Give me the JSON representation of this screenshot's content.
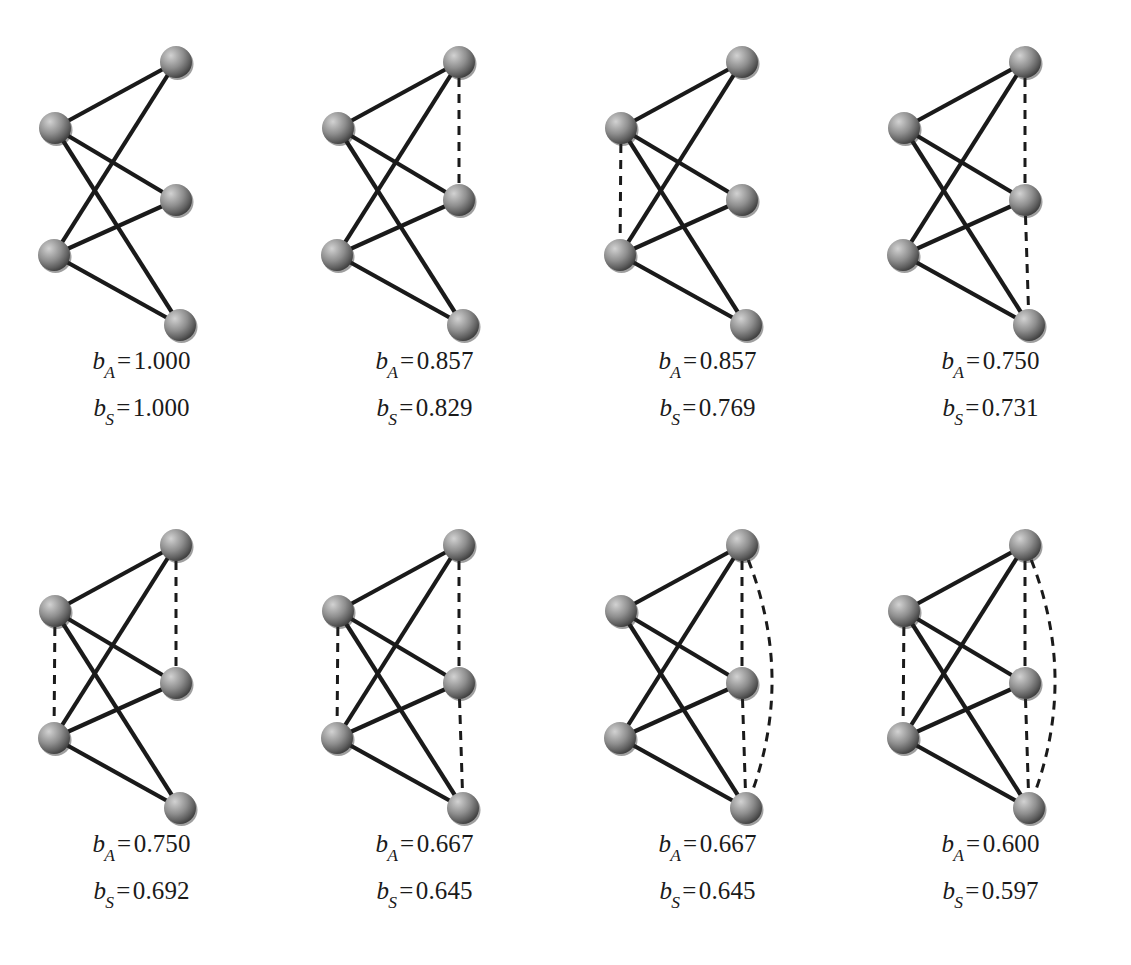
{
  "figure": {
    "node_count_per_graph": 5,
    "grid": {
      "rows": 2,
      "cols": 4
    },
    "colors": {
      "node_fill_light": "#b9b9b9",
      "node_fill_mid": "#8a8a8a",
      "node_fill_dark": "#3a3a3a",
      "edge_solid": "#1a1a1a",
      "edge_dashed": "#1a1a1a",
      "background": "#ffffff",
      "text": "#1a1a1a"
    },
    "node_positions": [
      {
        "id": "top-right",
        "x": 176,
        "y": 62
      },
      {
        "id": "left-upper",
        "x": 55,
        "y": 128
      },
      {
        "id": "right-middle",
        "x": 176,
        "y": 200
      },
      {
        "id": "left-lower",
        "x": 54,
        "y": 255
      },
      {
        "id": "bottom-right",
        "x": 180,
        "y": 325
      }
    ],
    "solid_edges": [
      [
        "left-upper",
        "top-right"
      ],
      [
        "left-upper",
        "right-middle"
      ],
      [
        "left-upper",
        "bottom-right"
      ],
      [
        "left-lower",
        "top-right"
      ],
      [
        "left-lower",
        "right-middle"
      ],
      [
        "left-lower",
        "bottom-right"
      ]
    ],
    "label_symbols": {
      "b": "b",
      "sub_a": "A",
      "sub_s": "S",
      "equals": "="
    }
  },
  "chart_data": {
    "type": "diagram",
    "series": [
      {
        "name": "b_A",
        "values": [
          1.0,
          0.857,
          0.857,
          0.75,
          0.75,
          0.667,
          0.667,
          0.6
        ]
      },
      {
        "name": "b_S",
        "values": [
          1.0,
          0.829,
          0.769,
          0.731,
          0.692,
          0.645,
          0.645,
          0.597
        ]
      }
    ],
    "categories": [
      "g1",
      "g2",
      "g3",
      "g4",
      "g5",
      "g6",
      "g7",
      "g8"
    ]
  },
  "graphs": [
    {
      "id": "g1",
      "index": 1,
      "row": 0,
      "col": 0,
      "b_a_label": "b",
      "b_a_sub": "A",
      "b_a_eq": "=",
      "b_a_value": "1.000",
      "b_s_label": "b",
      "b_s_sub": "S",
      "b_s_eq": "=",
      "b_s_value": "1.000",
      "dashed_edges": [],
      "dashed_arc": false,
      "dashed_count": 0
    },
    {
      "id": "g2",
      "index": 2,
      "row": 0,
      "col": 1,
      "b_a_label": "b",
      "b_a_sub": "A",
      "b_a_eq": "=",
      "b_a_value": "0.857",
      "b_s_label": "b",
      "b_s_sub": "S",
      "b_s_eq": "=",
      "b_s_value": "0.829",
      "dashed_edges": [
        [
          "top-right",
          "right-middle"
        ]
      ],
      "dashed_arc": false,
      "dashed_count": 1
    },
    {
      "id": "g3",
      "index": 3,
      "row": 0,
      "col": 2,
      "b_a_label": "b",
      "b_a_sub": "A",
      "b_a_eq": "=",
      "b_a_value": "0.857",
      "b_s_label": "b",
      "b_s_sub": "S",
      "b_s_eq": "=",
      "b_s_value": "0.769",
      "dashed_edges": [
        [
          "left-upper",
          "left-lower"
        ]
      ],
      "dashed_arc": false,
      "dashed_count": 1
    },
    {
      "id": "g4",
      "index": 4,
      "row": 0,
      "col": 3,
      "b_a_label": "b",
      "b_a_sub": "A",
      "b_a_eq": "=",
      "b_a_value": "0.750",
      "b_s_label": "b",
      "b_s_sub": "S",
      "b_s_eq": "=",
      "b_s_value": "0.731",
      "dashed_edges": [
        [
          "top-right",
          "right-middle"
        ],
        [
          "right-middle",
          "bottom-right"
        ]
      ],
      "dashed_arc": false,
      "dashed_count": 2
    },
    {
      "id": "g5",
      "index": 5,
      "row": 1,
      "col": 0,
      "b_a_label": "b",
      "b_a_sub": "A",
      "b_a_eq": "=",
      "b_a_value": "0.750",
      "b_s_label": "b",
      "b_s_sub": "S",
      "b_s_eq": "=",
      "b_s_value": "0.692",
      "dashed_edges": [
        [
          "left-upper",
          "left-lower"
        ],
        [
          "top-right",
          "right-middle"
        ]
      ],
      "dashed_arc": false,
      "dashed_count": 2
    },
    {
      "id": "g6",
      "index": 6,
      "row": 1,
      "col": 1,
      "b_a_label": "b",
      "b_a_sub": "A",
      "b_a_eq": "=",
      "b_a_value": "0.667",
      "b_s_label": "b",
      "b_s_sub": "S",
      "b_s_eq": "=",
      "b_s_value": "0.645",
      "dashed_edges": [
        [
          "left-upper",
          "left-lower"
        ],
        [
          "top-right",
          "right-middle"
        ],
        [
          "right-middle",
          "bottom-right"
        ]
      ],
      "dashed_arc": false,
      "dashed_count": 3
    },
    {
      "id": "g7",
      "index": 7,
      "row": 1,
      "col": 2,
      "b_a_label": "b",
      "b_a_sub": "A",
      "b_a_eq": "=",
      "b_a_value": "0.667",
      "b_s_label": "b",
      "b_s_sub": "S",
      "b_s_eq": "=",
      "b_s_value": "0.645",
      "dashed_edges": [
        [
          "top-right",
          "right-middle"
        ],
        [
          "right-middle",
          "bottom-right"
        ]
      ],
      "dashed_arc": true,
      "dashed_count": 3
    },
    {
      "id": "g8",
      "index": 8,
      "row": 1,
      "col": 3,
      "b_a_label": "b",
      "b_a_sub": "A",
      "b_a_eq": "=",
      "b_a_value": "0.600",
      "b_s_label": "b",
      "b_s_sub": "S",
      "b_s_eq": "=",
      "b_s_value": "0.597",
      "dashed_edges": [
        [
          "left-upper",
          "left-lower"
        ],
        [
          "top-right",
          "right-middle"
        ],
        [
          "right-middle",
          "bottom-right"
        ]
      ],
      "dashed_arc": true,
      "dashed_count": 4
    }
  ]
}
